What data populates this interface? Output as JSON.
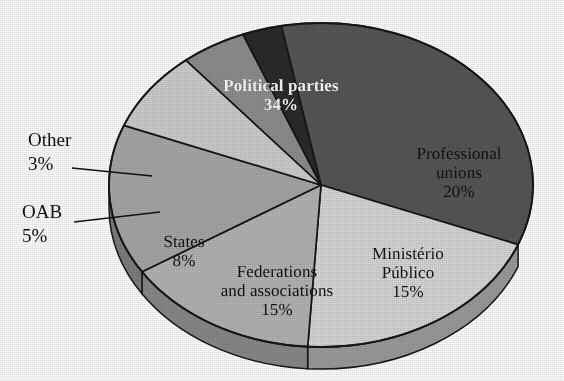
{
  "chart_data": {
    "type": "pie",
    "title": "",
    "subtitle": "",
    "xlabel": "",
    "ylabel": "",
    "legend_position": "none",
    "grid": false,
    "units": "percent",
    "total": 100,
    "categories": [
      "Political parties",
      "Professional unions",
      "Ministério Público",
      "Federations and associations",
      "States",
      "OAB",
      "Other"
    ],
    "values": [
      34,
      20,
      15,
      15,
      8,
      5,
      3
    ],
    "value_labels": [
      "34%",
      "20%",
      "15%",
      "15%",
      "8%",
      "5%",
      "3%"
    ],
    "slices": [
      {
        "name": "Political parties",
        "label": "Political parties",
        "label_lines": [
          "Political parties"
        ],
        "value": 34,
        "value_label": "34%",
        "color": "#575757",
        "side_color": "#3c3c3c",
        "label_placement": "inside",
        "label_color": "#ffffff",
        "label_bold": true
      },
      {
        "name": "Professional unions",
        "label": "Professional unions",
        "label_lines": [
          "Professional",
          "unions"
        ],
        "value": 20,
        "value_label": "20%",
        "color": "#d8d8d8",
        "side_color": "#9c9c9c",
        "label_placement": "inside",
        "label_color": "#111111",
        "label_bold": false
      },
      {
        "name": "Ministério Público",
        "label": "Ministério Público",
        "label_lines": [
          "Ministério",
          "Público"
        ],
        "value": 15,
        "value_label": "15%",
        "color": "#b5b5b5",
        "side_color": "#8a8a8a",
        "label_placement": "inside",
        "label_color": "#111111",
        "label_bold": false
      },
      {
        "name": "Federations and associations",
        "label": "Federations and associations",
        "label_lines": [
          "Federations",
          "and associations"
        ],
        "value": 15,
        "value_label": "15%",
        "color": "#a8a8a8",
        "side_color": "#7e7e7e",
        "label_placement": "inside",
        "label_color": "#111111",
        "label_bold": false
      },
      {
        "name": "States",
        "label": "States",
        "label_lines": [
          "States"
        ],
        "value": 8,
        "value_label": "8%",
        "color": "#cfcfcf",
        "side_color": "#989898",
        "label_placement": "inside",
        "label_color": "#111111",
        "label_bold": false
      },
      {
        "name": "OAB",
        "label": "OAB",
        "label_lines": [
          "OAB"
        ],
        "value": 5,
        "value_label": "5%",
        "color": "#8f8f8f",
        "side_color": "#6a6a6a",
        "label_placement": "callout-left",
        "label_color": "#111111",
        "label_bold": false
      },
      {
        "name": "Other",
        "label": "Other",
        "label_lines": [
          "Other"
        ],
        "value": 3,
        "value_label": "3%",
        "color": "#2b2b2b",
        "side_color": "#1d1d1d",
        "label_placement": "callout-left",
        "label_color": "#111111",
        "label_bold": false
      }
    ],
    "colors": [
      "#575757",
      "#d8d8d8",
      "#b5b5b5",
      "#a8a8a8",
      "#cfcfcf",
      "#8f8f8f",
      "#2b2b2b"
    ],
    "background_color": "#ffffff",
    "outline_color": "#171717",
    "style": "3d-pie-grayscale"
  }
}
